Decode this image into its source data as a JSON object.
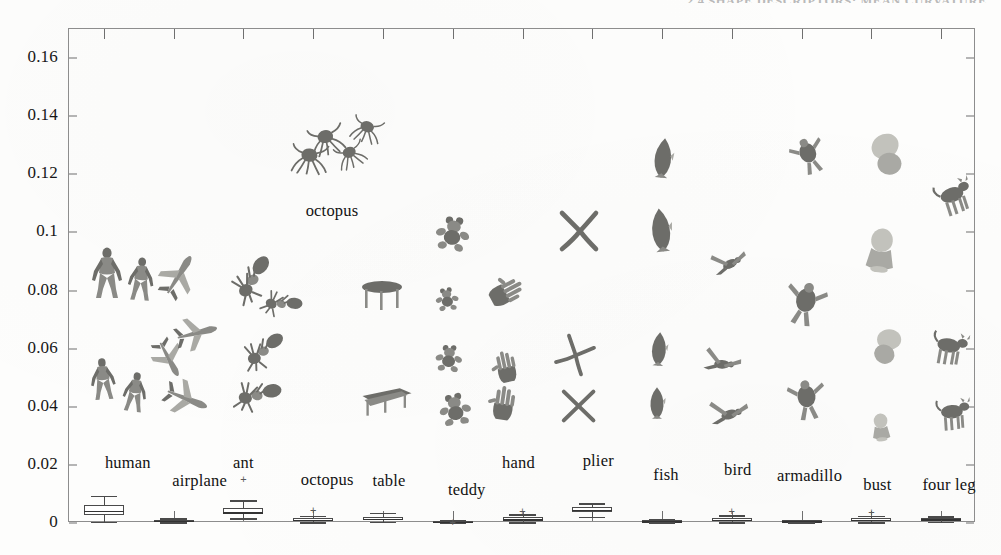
{
  "running_head": "2.4  SHAPE DESCRIPTORS: MEAN CURVATURE",
  "chart_data": {
    "type": "box",
    "title": "",
    "xlabel": "",
    "ylabel": "",
    "ylim": [
      0,
      0.17
    ],
    "ytick_labels": [
      "0",
      "0.02",
      "0.04",
      "0.06",
      "0.08",
      "0.1",
      "0.12",
      "0.14",
      "0.16"
    ],
    "ytick_values": [
      0,
      0.02,
      0.04,
      0.06,
      0.08,
      0.1,
      0.12,
      0.14,
      0.16
    ],
    "grid": false,
    "legend": "none",
    "categories": [
      "human",
      "airplane",
      "ant",
      "octopus",
      "table",
      "teddy",
      "hand",
      "plier",
      "fish",
      "bird",
      "armadillo",
      "bust",
      "four leg"
    ],
    "boxes": [
      {
        "name": "human",
        "whisker_low": 0.0005,
        "q1": 0.0028,
        "median": 0.0042,
        "q3": 0.0063,
        "whisker_high": 0.0094,
        "outliers": []
      },
      {
        "name": "airplane",
        "whisker_low": 0.0002,
        "q1": 0.0005,
        "median": 0.0008,
        "q3": 0.0011,
        "whisker_high": 0.0016,
        "outliers": []
      },
      {
        "name": "ant",
        "whisker_low": 0.0016,
        "q1": 0.003,
        "median": 0.0038,
        "q3": 0.0052,
        "whisker_high": 0.0078,
        "outliers": [
          0.0152
        ]
      },
      {
        "name": "octopus",
        "whisker_low": 0.0002,
        "q1": 0.0007,
        "median": 0.0011,
        "q3": 0.0016,
        "whisker_high": 0.0024,
        "outliers": [
          0.0046
        ]
      },
      {
        "name": "table",
        "whisker_low": 0.0004,
        "q1": 0.0011,
        "median": 0.0015,
        "q3": 0.0022,
        "whisker_high": 0.0036,
        "outliers": []
      },
      {
        "name": "teddy",
        "whisker_low": 0.0001,
        "q1": 0.0003,
        "median": 0.0005,
        "q3": 0.0007,
        "whisker_high": 0.001,
        "outliers": [
          0.0005
        ]
      },
      {
        "name": "hand",
        "whisker_low": 0.0003,
        "q1": 0.0009,
        "median": 0.0014,
        "q3": 0.0021,
        "whisker_high": 0.003,
        "outliers": [
          0.0043
        ]
      },
      {
        "name": "plier",
        "whisker_low": 0.0022,
        "q1": 0.0037,
        "median": 0.0046,
        "q3": 0.0056,
        "whisker_high": 0.0068,
        "outliers": []
      },
      {
        "name": "fish",
        "whisker_low": 0.0002,
        "q1": 0.0004,
        "median": 0.0007,
        "q3": 0.001,
        "whisker_high": 0.0014,
        "outliers": []
      },
      {
        "name": "bird",
        "whisker_low": 0.0003,
        "q1": 0.0008,
        "median": 0.0012,
        "q3": 0.0018,
        "whisker_high": 0.0026,
        "outliers": [
          0.004
        ]
      },
      {
        "name": "armadillo",
        "whisker_low": 0.0002,
        "q1": 0.0004,
        "median": 0.0006,
        "q3": 0.0009,
        "whisker_high": 0.0012,
        "outliers": []
      },
      {
        "name": "bust",
        "whisker_low": 0.0003,
        "q1": 0.0008,
        "median": 0.0012,
        "q3": 0.0017,
        "whisker_high": 0.0024,
        "outliers": [
          0.0039
        ]
      },
      {
        "name": "four leg",
        "whisker_low": 0.0004,
        "q1": 0.0009,
        "median": 0.0013,
        "q3": 0.0018,
        "whisker_high": 0.0023,
        "outliers": []
      }
    ],
    "thumbnail_columns": [
      {
        "category": "human",
        "model_count": 4
      },
      {
        "category": "airplane",
        "model_count": 4
      },
      {
        "category": "ant",
        "model_count": 4
      },
      {
        "category": "octopus",
        "model_count": 4
      },
      {
        "category": "table",
        "model_count": 2
      },
      {
        "category": "teddy",
        "model_count": 4
      },
      {
        "category": "hand",
        "model_count": 3
      },
      {
        "category": "plier",
        "model_count": 3
      },
      {
        "category": "fish",
        "model_count": 4
      },
      {
        "category": "bird",
        "model_count": 3
      },
      {
        "category": "armadillo",
        "model_count": 3
      },
      {
        "category": "bust",
        "model_count": 4
      },
      {
        "category": "four leg",
        "model_count": 3
      }
    ]
  },
  "axis": {
    "y_tick_0": "0",
    "y_tick_1": "0.02",
    "y_tick_2": "0.04",
    "y_tick_3": "0.06",
    "y_tick_4": "0.08",
    "y_tick_5": "0.1",
    "y_tick_6": "0.12",
    "y_tick_7": "0.14",
    "y_tick_8": "0.16"
  },
  "labels": {
    "human": "human",
    "airplane": "airplane",
    "ant": "ant",
    "octopus_box": "octopus",
    "octopus_cloud": "octopus",
    "table": "table",
    "teddy": "teddy",
    "hand": "hand",
    "plier": "plier",
    "fish": "fish",
    "bird": "bird",
    "armadillo": "armadillo",
    "bust": "bust",
    "four_leg": "four leg"
  },
  "colors": {
    "frame": "#8d8d8d",
    "box_stroke": "#4a4a4a",
    "text": "#121212",
    "mesh": "#8a8a86",
    "paper": "#fdfdfc"
  }
}
